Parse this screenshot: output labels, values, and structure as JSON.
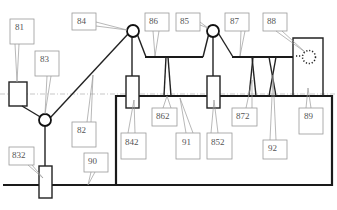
{
  "diagram": {
    "title": "",
    "labels": {
      "l81": "81",
      "l83": "83",
      "l84": "84",
      "l86": "86",
      "l85": "85",
      "l87": "87",
      "l88": "88",
      "l82": "82",
      "l832": "832",
      "l90": "90",
      "l842": "842",
      "l862": "862",
      "l91": "91",
      "l852": "852",
      "l872": "872",
      "l92": "92",
      "l89": "89"
    },
    "components": [
      {
        "id": "81",
        "kind": "block"
      },
      {
        "id": "82",
        "kind": "cable"
      },
      {
        "id": "83",
        "kind": "pulley"
      },
      {
        "id": "832",
        "kind": "block"
      },
      {
        "id": "84",
        "kind": "pulley"
      },
      {
        "id": "842",
        "kind": "block"
      },
      {
        "id": "85",
        "kind": "pulley"
      },
      {
        "id": "852",
        "kind": "block"
      },
      {
        "id": "86",
        "kind": "beam"
      },
      {
        "id": "862",
        "kind": "support"
      },
      {
        "id": "87",
        "kind": "beam"
      },
      {
        "id": "872",
        "kind": "crossed-support"
      },
      {
        "id": "88",
        "kind": "dotted-circle"
      },
      {
        "id": "89",
        "kind": "enclosure"
      },
      {
        "id": "90",
        "kind": "ground-line"
      },
      {
        "id": "91",
        "kind": "base-frame"
      },
      {
        "id": "92",
        "kind": "crossed-support"
      }
    ]
  }
}
